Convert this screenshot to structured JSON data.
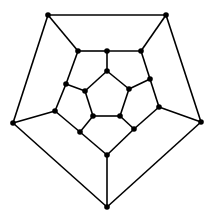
{
  "diagram": {
    "type": "graph",
    "colors": {
      "edge": "#000000",
      "node": "#000000",
      "background": "#ffffff"
    },
    "node_radius": 2.8,
    "nodes": [
      {
        "id": "o1",
        "x": 48,
        "y": 15
      },
      {
        "id": "o2",
        "x": 166,
        "y": 15
      },
      {
        "id": "o3",
        "x": 201,
        "y": 122
      },
      {
        "id": "o4",
        "x": 107,
        "y": 207
      },
      {
        "id": "o5",
        "x": 13,
        "y": 123
      },
      {
        "id": "m1",
        "x": 78,
        "y": 51
      },
      {
        "id": "m2",
        "x": 107,
        "y": 51
      },
      {
        "id": "m3",
        "x": 141,
        "y": 51
      },
      {
        "id": "m4",
        "x": 150,
        "y": 79
      },
      {
        "id": "m5",
        "x": 159,
        "y": 107
      },
      {
        "id": "m6",
        "x": 134,
        "y": 129
      },
      {
        "id": "m7",
        "x": 107,
        "y": 155
      },
      {
        "id": "m8",
        "x": 80,
        "y": 132
      },
      {
        "id": "m9",
        "x": 55,
        "y": 111
      },
      {
        "id": "m10",
        "x": 66,
        "y": 84
      },
      {
        "id": "i1",
        "x": 107,
        "y": 71
      },
      {
        "id": "i2",
        "x": 129,
        "y": 89
      },
      {
        "id": "i3",
        "x": 120,
        "y": 116
      },
      {
        "id": "i4",
        "x": 93,
        "y": 116
      },
      {
        "id": "i5",
        "x": 85,
        "y": 91
      }
    ],
    "edges": [
      [
        "o1",
        "o2"
      ],
      [
        "o2",
        "o3"
      ],
      [
        "o3",
        "o4"
      ],
      [
        "o4",
        "o5"
      ],
      [
        "o5",
        "o1"
      ],
      [
        "o1",
        "m1"
      ],
      [
        "o2",
        "m3"
      ],
      [
        "o3",
        "m5"
      ],
      [
        "o4",
        "m7"
      ],
      [
        "o5",
        "m9"
      ],
      [
        "m1",
        "m2"
      ],
      [
        "m2",
        "m3"
      ],
      [
        "m3",
        "m4"
      ],
      [
        "m4",
        "m5"
      ],
      [
        "m5",
        "m6"
      ],
      [
        "m6",
        "m7"
      ],
      [
        "m7",
        "m8"
      ],
      [
        "m8",
        "m9"
      ],
      [
        "m9",
        "m10"
      ],
      [
        "m10",
        "m1"
      ],
      [
        "m2",
        "i1"
      ],
      [
        "m4",
        "i2"
      ],
      [
        "m6",
        "i3"
      ],
      [
        "m8",
        "i4"
      ],
      [
        "m10",
        "i5"
      ],
      [
        "i1",
        "i2"
      ],
      [
        "i2",
        "i3"
      ],
      [
        "i3",
        "i4"
      ],
      [
        "i4",
        "i5"
      ],
      [
        "i5",
        "i1"
      ]
    ]
  }
}
